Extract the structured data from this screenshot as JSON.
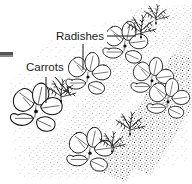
{
  "figure": {
    "medium": "black-and-white stippled line engraving",
    "background_color": "#ffffff",
    "ink_color": "#111111",
    "soil_color": "#4a4a4a",
    "width": 192,
    "height": 184
  },
  "labels": [
    {
      "id": "radishes",
      "text": "Radishes",
      "x": 56,
      "y": 40,
      "font_size": 11.5,
      "color": "#1b1b1b",
      "leaders": [
        {
          "type": "horizontal",
          "x1": 106,
          "y1": 36,
          "x2": 136,
          "y2": 36
        },
        {
          "type": "vertical",
          "x1": 83,
          "y1": 44,
          "x2": 83,
          "y2": 70
        }
      ]
    },
    {
      "id": "carrots",
      "text": "Carrots",
      "x": 26,
      "y": 71,
      "font_size": 11.5,
      "color": "#1b1b1b",
      "leaders": [
        {
          "type": "vertical",
          "x1": 46,
          "y1": 76,
          "x2": 46,
          "y2": 103
        },
        {
          "type": "arrow",
          "x1": 55,
          "y1": 76,
          "x2": 69,
          "y2": 92
        }
      ]
    }
  ],
  "edge_marks": [
    {
      "id": "left-edge-bar",
      "x": 0,
      "y": 52,
      "width": 13,
      "height": 3,
      "color": "#555555"
    },
    {
      "id": "left-edge-bar-light",
      "x": 0,
      "y": 55,
      "width": 13,
      "height": 2,
      "color": "#8a8a8a"
    }
  ],
  "soil": {
    "description": "stippled soil bed with diagonal planting rows running lower-left to upper-right",
    "row_angle_deg": -38,
    "row_count": 3,
    "stipple_density": "dense in rows, sparse between"
  },
  "plants": {
    "radish": {
      "common_name": "Radishes",
      "drawn_as": "broad-leaved rosette seedling",
      "count": 6,
      "positions": [
        {
          "x": 36,
          "y": 108,
          "scale": 1.15
        },
        {
          "x": 88,
          "y": 74,
          "scale": 1.0
        },
        {
          "x": 125,
          "y": 43,
          "scale": 1.0
        },
        {
          "x": 152,
          "y": 78,
          "scale": 0.95
        },
        {
          "x": 166,
          "y": 98,
          "scale": 0.95
        },
        {
          "x": 90,
          "y": 150,
          "scale": 1.05
        }
      ]
    },
    "carrot": {
      "common_name": "Carrots",
      "drawn_as": "fine feathery frond seedling",
      "count": 5,
      "positions": [
        {
          "x": 61,
          "y": 95,
          "scale": 1.0
        },
        {
          "x": 140,
          "y": 30,
          "scale": 1.0
        },
        {
          "x": 154,
          "y": 18,
          "scale": 0.85
        },
        {
          "x": 130,
          "y": 128,
          "scale": 1.0
        },
        {
          "x": 112,
          "y": 146,
          "scale": 0.9
        }
      ]
    }
  }
}
